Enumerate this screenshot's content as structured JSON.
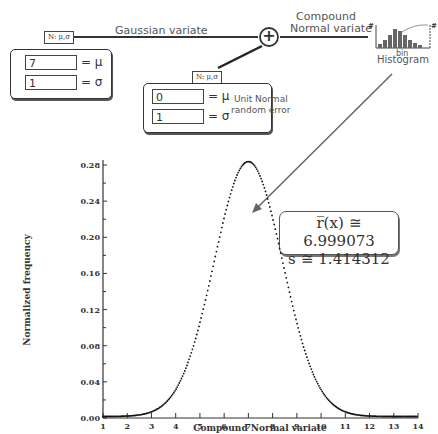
{
  "diagram": {
    "gaussian_source": {
      "node_label": "N: μ,σ",
      "link_label": "Gaussian variate",
      "mu_value": "7",
      "sigma_value": "1",
      "mu_symbol": "= μ",
      "sigma_symbol": "= σ"
    },
    "error_source": {
      "node_label": "N: μ,σ",
      "mu_value": "0",
      "sigma_value": "1",
      "mu_symbol": "= μ",
      "sigma_symbol": "= σ",
      "description_line1": "Unit Normal",
      "description_line2": "random error"
    },
    "adder": {
      "symbol": "+"
    },
    "output_link": {
      "line1": "Compound",
      "line2": "Normal variate"
    },
    "histogram": {
      "label": "Histogram",
      "bin_label": "bin",
      "count_label": "#"
    },
    "stats": {
      "mean_label": "r̅(x) ≅ 6.999073",
      "sd_label": "s ≅ 1.414312"
    }
  },
  "chart_data": {
    "type": "scatter",
    "title": "",
    "xlabel": "Compound Normal variate",
    "ylabel": "Normalized frequency",
    "xlim": [
      1,
      14
    ],
    "ylim": [
      0,
      0.3
    ],
    "xticks": [
      "1",
      "2",
      "3",
      "4",
      "5",
      "6",
      "7",
      "8",
      "9",
      "10",
      "11",
      "12",
      "13",
      "14"
    ],
    "yticks": [
      "0.00",
      "0.04",
      "0.08",
      "0.12",
      "0.16",
      "0.20",
      "0.24",
      "0.28"
    ],
    "grid": false,
    "series": [
      {
        "name": "Compound Normal variate distribution",
        "distribution": "normal",
        "mean": 6.999073,
        "sd": 1.414312,
        "x": [
          1,
          1.5,
          2,
          2.5,
          3,
          3.5,
          4,
          4.5,
          5,
          5.5,
          6,
          6.5,
          7,
          7.5,
          8,
          8.5,
          9,
          9.5,
          10,
          10.5,
          11,
          11.5,
          12,
          12.5,
          13,
          13.5,
          14
        ],
        "values": [
          0.0003,
          0.0009,
          0.0025,
          0.0058,
          0.0117,
          0.0211,
          0.0299,
          0.0483,
          0.1038,
          0.1613,
          0.2196,
          0.265,
          0.2821,
          0.265,
          0.2196,
          0.1613,
          0.1038,
          0.0583,
          0.0299,
          0.0134,
          0.0052,
          0.0018,
          0.0005,
          0.0001,
          0.0,
          0.0,
          0.0
        ]
      }
    ]
  }
}
